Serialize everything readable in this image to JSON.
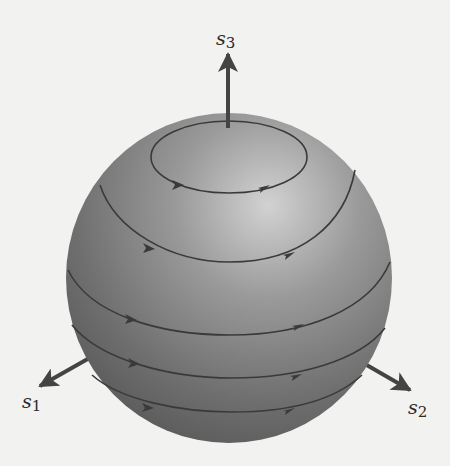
{
  "figure": {
    "colors": {
      "background": "#f2f2f0",
      "sphere_light": "#c9c9c9",
      "sphere_mid": "#8a8a8a",
      "sphere_dark": "#5c5c5c",
      "lines": "#3a3a3a",
      "axes": "#444444"
    },
    "axes": [
      {
        "name": "s3",
        "base": "s",
        "sub": "3",
        "direction": "up"
      },
      {
        "name": "s1",
        "base": "s",
        "sub": "1",
        "direction": "lower-left"
      },
      {
        "name": "s2",
        "base": "s",
        "sub": "2",
        "direction": "lower-right"
      }
    ],
    "flow_lines": [
      {
        "id": 1,
        "label": "top circle",
        "arrows": 2,
        "direction": "counterclockwise-from-above"
      },
      {
        "id": 2,
        "label": "upper latitude",
        "arrows": 2
      },
      {
        "id": 3,
        "label": "equatorial latitude",
        "arrows": 2
      },
      {
        "id": 4,
        "label": "lower latitude",
        "arrows": 2
      },
      {
        "id": 5,
        "label": "bottom latitude",
        "arrows": 2
      }
    ]
  }
}
